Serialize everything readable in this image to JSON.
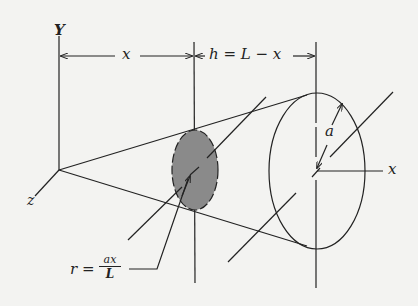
{
  "figure": {
    "labels": {
      "y_axis": "Y",
      "z_axis": "z",
      "x_axis": "x",
      "dim_x": "x",
      "dim_h": "h = L − x",
      "radius_a": "a",
      "r_lhs": "r =",
      "r_num": "ax",
      "r_den": "L"
    },
    "colors": {
      "background": "#f3f3f1",
      "ink": "#222222",
      "disk_fill": "#8a8a8a"
    }
  }
}
